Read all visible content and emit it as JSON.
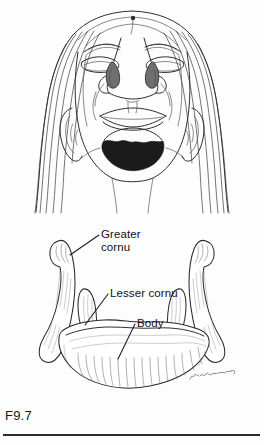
{
  "figure": {
    "number": "F9.7",
    "signature": "M.Lewis"
  },
  "panels": {
    "face": {
      "name": "upturned-face-illustration",
      "description": "Line drawing of a face viewed from below with head tilted back"
    },
    "bone": {
      "name": "hyoid-bone-illustration",
      "description": "Line drawing of the hyoid bone viewed from above"
    }
  },
  "labels": {
    "greater_cornu": "Greater\ncornu",
    "lesser_cornu": "Lesser cornu",
    "body": "Body"
  },
  "colors": {
    "ink": "#2e2e2e",
    "shadow": "#1b1b1b",
    "hatch": "#6e6e6e",
    "text": "#111111",
    "rule": "#2b2b2b",
    "background": "#ffffff"
  }
}
